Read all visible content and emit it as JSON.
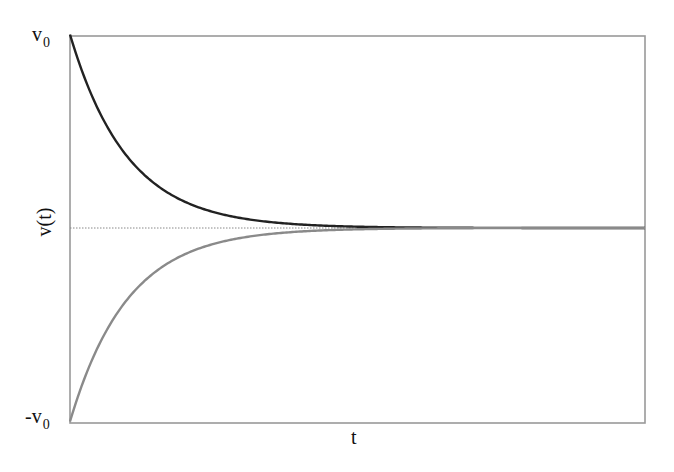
{
  "chart_data": {
    "type": "line",
    "title": "",
    "xlabel": "t",
    "ylabel": "v(t)",
    "xlim": [
      0,
      10
    ],
    "ylim": [
      -1,
      1
    ],
    "y_tick_labels": [
      {
        "value": 1,
        "base": "v",
        "sub": "0",
        "prefix": ""
      },
      {
        "value": -1,
        "base": "v",
        "sub": "0",
        "prefix": "-"
      }
    ],
    "grid": false,
    "reference_line": {
      "y": 0,
      "style": "dotted",
      "color": "#888888"
    },
    "series": [
      {
        "name": "v(t) from +v0",
        "formula": "v0*exp(-t)",
        "color": "#222222",
        "x": [
          0,
          0.5,
          1,
          1.5,
          2,
          3,
          4,
          5,
          6,
          8,
          10
        ],
        "values": [
          1.0,
          0.607,
          0.368,
          0.223,
          0.135,
          0.05,
          0.018,
          0.007,
          0.002,
          0.0003,
          0.0
        ]
      },
      {
        "name": "v(t) from -v0",
        "formula": "-v0*exp(-t)",
        "color": "#8a8a8a",
        "x": [
          0,
          0.5,
          1,
          1.5,
          2,
          3,
          4,
          5,
          6,
          8,
          10
        ],
        "values": [
          -1.0,
          -0.607,
          -0.368,
          -0.223,
          -0.135,
          -0.05,
          -0.018,
          -0.007,
          -0.002,
          -0.0003,
          0.0
        ]
      }
    ],
    "frame_color": "#999999",
    "legend": null
  },
  "labels": {
    "y_top_base": "v",
    "y_top_sub": "0",
    "y_bottom_base": "-v",
    "y_bottom_sub": "0",
    "y_axis": "v(t)",
    "x_axis": "t"
  }
}
